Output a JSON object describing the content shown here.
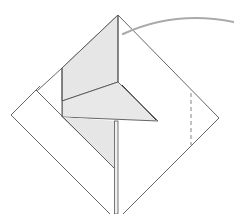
{
  "diagram": {
    "type": "origami-step",
    "colors": {
      "background": "#ffffff",
      "line": "#555555",
      "shade": "#e6e6e6",
      "arrow": "#aaaaaa",
      "dashed": "#777777"
    },
    "elements": [
      {
        "name": "paper-diamond",
        "kind": "outline"
      },
      {
        "name": "left-folded-strip",
        "kind": "flap"
      },
      {
        "name": "vertical-shaded-flap",
        "kind": "flap",
        "shaded": true
      },
      {
        "name": "triangle-fold",
        "kind": "flap",
        "shaded": true
      },
      {
        "name": "center-stem",
        "kind": "edge"
      },
      {
        "name": "valley-fold-dashed-line",
        "kind": "fold-line"
      },
      {
        "name": "curved-arrow",
        "kind": "arrow"
      }
    ]
  }
}
